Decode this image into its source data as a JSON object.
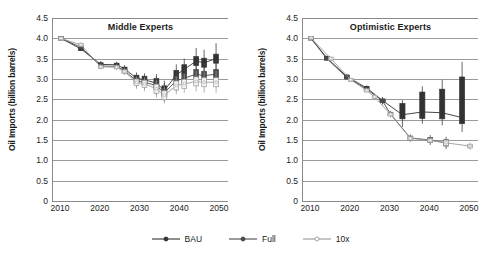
{
  "figure": {
    "ylabel": "Oil Imports (billion barrels)",
    "yticks": [
      "4.5",
      "4.0",
      "3.5",
      "3.0",
      "2.5",
      "2.0",
      "1.5",
      "1.0",
      "0.5",
      "0"
    ],
    "ytick_values": [
      4.5,
      4.0,
      3.5,
      3.0,
      2.5,
      2.0,
      1.5,
      1.0,
      0.5,
      0
    ],
    "xticks": [
      "2010",
      "2020",
      "2030",
      "2040",
      "2050"
    ],
    "xtick_values": [
      2010,
      2020,
      2030,
      2040,
      2050
    ],
    "ylim": [
      0,
      4.5
    ],
    "xlim": [
      2008,
      2052
    ],
    "grid": true,
    "legend_position": "bottom-center"
  },
  "legend": {
    "items": [
      {
        "label": "BAU",
        "color": "#333333",
        "marker": "filled-circle"
      },
      {
        "label": "Full",
        "color": "#4a4a4a",
        "marker": "filled-circle"
      },
      {
        "label": "10x",
        "color": "#9a9a9a",
        "marker": "open-circle"
      }
    ]
  },
  "chart_data": [
    {
      "type": "line",
      "title": "Middle Experts",
      "panel": "left",
      "xlabel": "",
      "ylabel": "Oil Imports (billion barrels)",
      "xlim": [
        2008,
        2052
      ],
      "ylim": [
        0,
        4.5
      ],
      "grid": true,
      "series": [
        {
          "name": "BAU",
          "color": "#333333",
          "marker": "filled-circle",
          "x": [
            2010,
            2015,
            2020,
            2024,
            2026,
            2029,
            2031,
            2034,
            2036,
            2039,
            2041,
            2044,
            2046,
            2049
          ],
          "values": [
            4.0,
            3.74,
            3.36,
            3.35,
            3.25,
            3.02,
            2.98,
            2.9,
            2.72,
            3.1,
            3.24,
            3.44,
            3.4,
            3.5
          ],
          "err_low": [
            3.98,
            3.7,
            3.3,
            3.3,
            3.18,
            2.88,
            2.8,
            2.66,
            2.48,
            2.84,
            2.96,
            3.1,
            3.02,
            3.06
          ],
          "err_high": [
            4.02,
            3.8,
            3.44,
            3.42,
            3.34,
            3.16,
            3.14,
            3.12,
            2.96,
            3.36,
            3.5,
            3.76,
            3.72,
            3.88
          ]
        },
        {
          "name": "Full",
          "color": "#4a4a4a",
          "marker": "filled-circle",
          "x": [
            2010,
            2015,
            2020,
            2024,
            2026,
            2029,
            2031,
            2034,
            2036,
            2039,
            2041,
            2044,
            2046,
            2049
          ],
          "values": [
            4.0,
            3.78,
            3.32,
            3.31,
            3.2,
            2.96,
            2.92,
            2.84,
            2.66,
            2.96,
            3.02,
            3.12,
            3.08,
            3.12
          ],
          "err_low": [
            3.98,
            3.72,
            3.26,
            3.25,
            3.12,
            2.8,
            2.76,
            2.6,
            2.44,
            2.7,
            2.78,
            2.84,
            2.8,
            2.8
          ],
          "err_high": [
            4.02,
            3.84,
            3.4,
            3.38,
            3.3,
            3.1,
            3.08,
            3.06,
            2.9,
            3.2,
            3.28,
            3.44,
            3.4,
            3.48
          ]
        },
        {
          "name": "10x",
          "color": "#9a9a9a",
          "marker": "open-circle",
          "x": [
            2010,
            2015,
            2020,
            2024,
            2026,
            2029,
            2031,
            2034,
            2036,
            2039,
            2041,
            2044,
            2046,
            2049
          ],
          "values": [
            4.0,
            3.84,
            3.3,
            3.29,
            3.18,
            2.92,
            2.88,
            2.76,
            2.6,
            2.84,
            2.88,
            2.94,
            2.92,
            2.92
          ],
          "err_low": [
            3.98,
            3.78,
            3.24,
            3.22,
            3.1,
            2.76,
            2.7,
            2.54,
            2.4,
            2.62,
            2.66,
            2.7,
            2.66,
            2.66
          ],
          "err_high": [
            4.02,
            3.9,
            3.38,
            3.36,
            3.28,
            3.06,
            3.04,
            2.98,
            2.82,
            3.06,
            3.12,
            3.2,
            3.18,
            3.2
          ]
        }
      ]
    },
    {
      "type": "line",
      "title": "Optimistic Experts",
      "panel": "right",
      "xlabel": "",
      "ylabel": "Oil Imports (billion barrels)",
      "xlim": [
        2008,
        2052
      ],
      "ylim": [
        0,
        4.5
      ],
      "grid": true,
      "series": [
        {
          "name": "BAU",
          "color": "#333333",
          "marker": "filled-circle",
          "x": [
            2010,
            2014,
            2019,
            2024,
            2028,
            2033,
            2038,
            2043,
            2048
          ],
          "values": [
            4.0,
            3.52,
            3.06,
            2.78,
            2.47,
            2.12,
            2.19,
            2.17,
            2.05
          ],
          "err_low": [
            3.97,
            3.47,
            3.0,
            2.72,
            2.38,
            1.82,
            1.9,
            1.86,
            1.7
          ],
          "err_high": [
            4.03,
            3.57,
            3.12,
            2.84,
            2.56,
            2.48,
            2.82,
            2.98,
            3.42
          ],
          "box_low": [
            3.99,
            3.49,
            3.03,
            2.75,
            2.43,
            2.02,
            2.03,
            2.02,
            1.9
          ],
          "box_high": [
            4.01,
            3.55,
            3.09,
            2.81,
            2.51,
            2.4,
            2.68,
            2.75,
            3.05
          ]
        },
        {
          "name": "Full",
          "color": "#4a4a4a",
          "marker": "filled-circle",
          "x": [
            2010,
            2014,
            2019,
            2024,
            2028,
            2030,
            2035,
            2040,
            2044
          ],
          "values": [
            4.0,
            3.5,
            3.04,
            2.75,
            2.46,
            2.14,
            1.55,
            1.5,
            1.43
          ],
          "err_low": [
            3.97,
            3.45,
            2.98,
            2.69,
            2.38,
            2.06,
            1.46,
            1.38,
            1.28
          ],
          "err_high": [
            4.03,
            3.55,
            3.1,
            2.81,
            2.54,
            2.22,
            1.64,
            1.62,
            1.58
          ]
        },
        {
          "name": "10x",
          "color": "#9a9a9a",
          "marker": "open-circle",
          "x": [
            2010,
            2015,
            2020,
            2024,
            2026,
            2030,
            2035,
            2040,
            2044,
            2050
          ],
          "values": [
            4.01,
            3.5,
            2.98,
            2.72,
            2.56,
            2.13,
            1.54,
            1.49,
            1.43,
            1.35
          ],
          "err_low": [
            3.98,
            3.46,
            2.94,
            2.67,
            2.5,
            2.06,
            1.46,
            1.4,
            1.3,
            1.26
          ],
          "err_high": [
            4.04,
            3.54,
            3.02,
            2.77,
            2.62,
            2.2,
            1.62,
            1.58,
            1.56,
            1.44
          ]
        }
      ]
    }
  ]
}
